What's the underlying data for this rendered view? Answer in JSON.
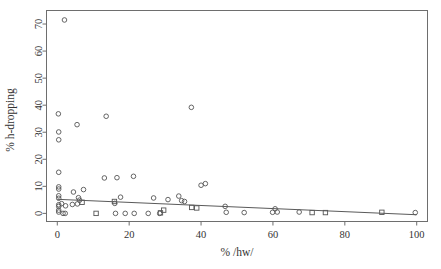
{
  "chart_data": {
    "type": "scatter",
    "title": "",
    "xlabel": "% /hw/",
    "ylabel": "% h-dropping",
    "xlim": [
      -3,
      103
    ],
    "ylim": [
      -3,
      75
    ],
    "xticks": [
      0,
      20,
      40,
      60,
      80,
      100
    ],
    "yticks": [
      0,
      10,
      20,
      30,
      40,
      50,
      60,
      70
    ],
    "xtick_labels": [
      "0",
      "20",
      "40",
      "60",
      "80",
      "100"
    ],
    "ytick_labels": [
      "0",
      "10",
      "20",
      "30",
      "40",
      "50",
      "60",
      "70"
    ],
    "grid": false,
    "legend": "none",
    "series": [
      {
        "name": "circles",
        "marker": "open-circle",
        "points": [
          [
            2.0,
            71.5
          ],
          [
            0.3,
            36.8
          ],
          [
            0.4,
            30.1
          ],
          [
            0.4,
            27.2
          ],
          [
            5.5,
            32.8
          ],
          [
            13.6,
            35.9
          ],
          [
            37.3,
            39.2
          ],
          [
            0.4,
            15.2
          ],
          [
            13.1,
            13.1
          ],
          [
            16.6,
            13.2
          ],
          [
            21.2,
            13.7
          ],
          [
            40.0,
            10.4
          ],
          [
            41.2,
            11.0
          ],
          [
            0.4,
            9.8
          ],
          [
            0.4,
            9.0
          ],
          [
            4.5,
            7.9
          ],
          [
            7.3,
            8.8
          ],
          [
            0.4,
            6.5
          ],
          [
            0.4,
            5.6
          ],
          [
            5.9,
            5.8
          ],
          [
            6.2,
            4.9
          ],
          [
            17.6,
            6.0
          ],
          [
            16.0,
            3.7
          ],
          [
            26.8,
            5.7
          ],
          [
            30.8,
            5.1
          ],
          [
            33.8,
            6.4
          ],
          [
            34.6,
            4.7
          ],
          [
            35.4,
            4.4
          ],
          [
            46.7,
            2.6
          ],
          [
            60.6,
            1.7
          ],
          [
            61.2,
            0.5
          ],
          [
            0.4,
            3.2
          ],
          [
            0.4,
            2.6
          ],
          [
            1.2,
            3.6
          ],
          [
            2.3,
            2.8
          ],
          [
            4.2,
            3.3
          ],
          [
            5.6,
            3.5
          ],
          [
            0.4,
            1.2
          ],
          [
            0.4,
            0.5
          ],
          [
            1.6,
            0.0
          ],
          [
            2.2,
            0.0
          ],
          [
            16.2,
            0.0
          ],
          [
            18.9,
            0.0
          ],
          [
            21.4,
            0.0
          ],
          [
            25.3,
            0.0
          ],
          [
            28.5,
            0.0
          ],
          [
            47.0,
            0.4
          ],
          [
            52.0,
            0.3
          ],
          [
            59.9,
            0.4
          ],
          [
            67.3,
            0.5
          ],
          [
            99.6,
            0.3
          ]
        ]
      },
      {
        "name": "squares",
        "marker": "open-square",
        "points": [
          [
            6.9,
            4.1
          ],
          [
            15.9,
            4.4
          ],
          [
            37.4,
            2.2
          ],
          [
            38.8,
            2.0
          ],
          [
            10.8,
            0.0
          ],
          [
            28.7,
            0.2
          ],
          [
            29.6,
            1.2
          ],
          [
            70.9,
            0.3
          ],
          [
            74.6,
            0.3
          ],
          [
            90.3,
            0.4
          ]
        ]
      }
    ],
    "regression": {
      "name": "fitted-line",
      "x_start": 0.0,
      "y_start": 5.2,
      "x_end": 100.0,
      "y_end": -0.5
    }
  }
}
